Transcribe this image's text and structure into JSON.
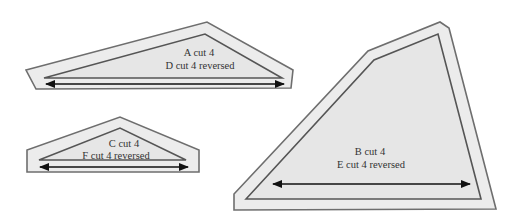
{
  "diagram": {
    "pieces": [
      {
        "id": "A",
        "line1": "A cut 4",
        "line2": "D cut 4 reversed"
      },
      {
        "id": "C",
        "line1": "C cut 4",
        "line2": "F cut 4 reversed"
      },
      {
        "id": "B",
        "line1": "B cut 4",
        "line2": "E cut 4 reversed"
      }
    ],
    "colors": {
      "background": "#ffffff",
      "seam_allowance_fill": "#ececec",
      "piece_fill": "#e6e6e6",
      "outline": "#555555",
      "grainline": "#111111"
    }
  }
}
